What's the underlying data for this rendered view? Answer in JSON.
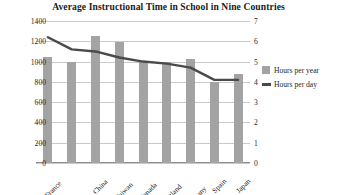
{
  "chart_data": {
    "type": "bar",
    "title": "Average Instructional Time in School in Nine Countries",
    "xlabel": "",
    "ylabel": "",
    "categories": [
      "France",
      "United States",
      "China",
      "Taiwan",
      "Canada",
      "England",
      "Germany",
      "Spain",
      "Japan"
    ],
    "grid": true,
    "legend_position": "right",
    "left_axis": {
      "name": "Hours per year",
      "ylim": [
        0,
        1400
      ],
      "ticks": [
        0,
        200,
        400,
        600,
        800,
        1000,
        1200,
        1400
      ],
      "tick_labels": [
        "0",
        "200",
        "400",
        "600",
        "800",
        "1000",
        "1200",
        "1400"
      ]
    },
    "right_axis": {
      "name": "Hours per day",
      "ylim": [
        0,
        7
      ],
      "ticks": [
        0,
        1,
        2,
        3,
        4,
        5,
        6,
        7
      ],
      "tick_labels": [
        "0",
        "1",
        "2",
        "3",
        "4",
        "5",
        "6",
        "7"
      ]
    },
    "series": [
      {
        "name": "Hours per year",
        "type": "bar",
        "axis": "left",
        "color": "#a3a3a3",
        "values": [
          1050,
          1000,
          1250,
          1190,
          1000,
          1000,
          1030,
          800,
          880
        ]
      },
      {
        "name": "Hours per day",
        "type": "line",
        "axis": "right",
        "color": "#4a4a4a",
        "values": [
          6.2,
          5.6,
          5.5,
          5.2,
          5.0,
          4.9,
          4.7,
          4.1,
          4.1
        ]
      }
    ]
  },
  "legend": {
    "items": [
      {
        "label": "Hours per year",
        "marker": "square-swatch"
      },
      {
        "label": "Hours per day",
        "marker": "line-swatch"
      }
    ]
  }
}
